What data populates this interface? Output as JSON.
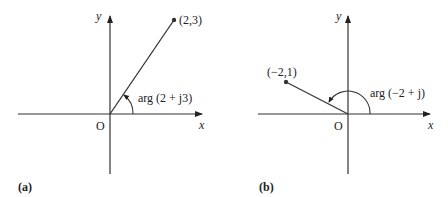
{
  "panels": [
    {
      "id": "a",
      "caption": "(a)",
      "axis_x_label": "x",
      "axis_y_label": "y",
      "origin_label": "O",
      "point_label": "(2,3)",
      "angle_label": "arg (2 + j3)"
    },
    {
      "id": "b",
      "caption": "(b)",
      "axis_x_label": "x",
      "axis_y_label": "y",
      "origin_label": "O",
      "point_label": "(−2,1)",
      "angle_label": "arg (−2 + j)"
    }
  ],
  "colors": {
    "stroke": "#333333",
    "background": "#ffffff"
  }
}
